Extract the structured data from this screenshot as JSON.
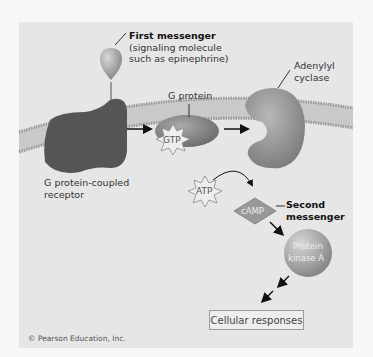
{
  "diagram": {
    "labels": {
      "first_messenger": "First messenger",
      "first_messenger_desc_1": "(signaling molecule",
      "first_messenger_desc_2": "such as epinephrine)",
      "g_protein": "G protein",
      "adenylyl_1": "Adenylyl",
      "adenylyl_2": "cyclase",
      "gpcr_1": "G protein-coupled",
      "gpcr_2": "receptor",
      "gtp": "GTP",
      "atp": "ATP",
      "camp": "cAMP",
      "second_1": "Second",
      "second_2": "messenger",
      "pka_1": "Protein",
      "pka_2": "kinase A",
      "cellular_responses": "Cellular responses"
    },
    "copyright": "© Pearson Education, Inc."
  }
}
